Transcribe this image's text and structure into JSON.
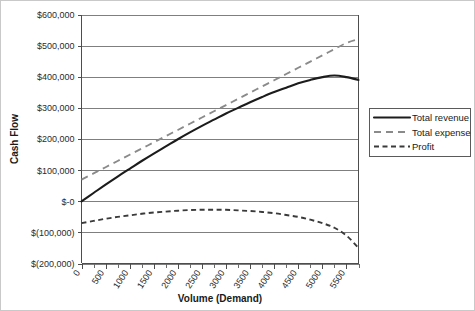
{
  "chart_data": {
    "type": "line",
    "title": "",
    "xlabel": "Volume (Demand)",
    "ylabel": "Cash Flow",
    "xlim": [
      0,
      5750
    ],
    "ylim": [
      -200000,
      600000
    ],
    "grid": "horizontal",
    "legend_position": "right",
    "y_ticks": [
      "$600,000",
      "$500,000",
      "$400,000",
      "$300,000",
      "$200,000",
      "$100,000",
      "$-0",
      "$(100,000)",
      "$(200,000)"
    ],
    "y_tick_values": [
      600000,
      500000,
      400000,
      300000,
      200000,
      100000,
      0,
      -100000,
      -200000
    ],
    "x_ticks": [
      "0",
      "500",
      "1000",
      "1500",
      "2000",
      "2500",
      "3000",
      "3500",
      "4000",
      "4500",
      "5000",
      "5500"
    ],
    "x_tick_values": [
      0,
      500,
      1000,
      1500,
      2000,
      2500,
      3000,
      3500,
      4000,
      4500,
      5000,
      5500
    ],
    "x": [
      0,
      250,
      500,
      750,
      1000,
      1250,
      1500,
      1750,
      2000,
      2250,
      2500,
      2750,
      3000,
      3250,
      3500,
      3750,
      4000,
      4250,
      4500,
      4750,
      5000,
      5250,
      5500,
      5750
    ],
    "series": [
      {
        "name": "Total revenue",
        "style": "solid",
        "color": "#1c1c1c",
        "values": [
          0,
          27000,
          54000,
          80000,
          105000,
          130000,
          154000,
          177000,
          200000,
          222000,
          243000,
          263000,
          283000,
          301000,
          319000,
          336000,
          352000,
          366000,
          380000,
          391000,
          400000,
          405000,
          400000,
          391000
        ]
      },
      {
        "name": "Total expense",
        "style": "dashed",
        "color": "#8a8a8a",
        "values": [
          70000,
          90000,
          110000,
          130000,
          150000,
          170000,
          190000,
          210000,
          230000,
          250000,
          270000,
          290000,
          310000,
          330000,
          350000,
          370000,
          390000,
          410000,
          430000,
          450000,
          470000,
          490000,
          510000,
          522000
        ]
      },
      {
        "name": "Profit",
        "style": "dotted",
        "color": "#3a3a3a",
        "values": [
          -70000,
          -63000,
          -56000,
          -50000,
          -45000,
          -40000,
          -36000,
          -33000,
          -30000,
          -28000,
          -27000,
          -27000,
          -27000,
          -29000,
          -31000,
          -34000,
          -38000,
          -44000,
          -50000,
          -59000,
          -70000,
          -85000,
          -110000,
          -150000
        ]
      }
    ],
    "legend": [
      {
        "label": "Total revenue",
        "style": "solid"
      },
      {
        "label": "Total expense",
        "style": "dashed"
      },
      {
        "label": "Profit",
        "style": "dotted"
      }
    ]
  }
}
